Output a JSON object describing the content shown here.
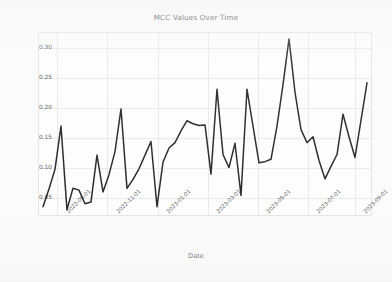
{
  "chart_data": {
    "type": "line",
    "title": "MCC Values Over Time",
    "xlabel": "Date",
    "ylabel": "MCC Value",
    "grid": true,
    "legend": null,
    "line_color": "#141414",
    "background_color": "#fbfbfb",
    "ylim": [
      0.018,
      0.325
    ],
    "ytick_labels": [
      "0.05",
      "0.10",
      "0.15",
      "0.20",
      "0.25",
      "0.30"
    ],
    "ytick_values": [
      0.05,
      0.1,
      0.15,
      0.2,
      0.25,
      0.3
    ],
    "xtick_labels": [
      "2022-09-01",
      "2022-11-01",
      "2023-01-01",
      "2023-03-01",
      "2023-05-01",
      "2023-07-01",
      "2023-09-01"
    ],
    "xtick_positions": [
      0.055,
      0.205,
      0.355,
      0.505,
      0.655,
      0.805,
      0.945
    ],
    "x_index": [
      0,
      1,
      2,
      3,
      4,
      5,
      6,
      7,
      8,
      9,
      10,
      11,
      12,
      13,
      14,
      15,
      16,
      17,
      18,
      19,
      20,
      21,
      22,
      23,
      24,
      25,
      26,
      27,
      28,
      29,
      30,
      31,
      32,
      33,
      34,
      35,
      36,
      37,
      38,
      39,
      40,
      41,
      42,
      43,
      44,
      45,
      46,
      47,
      48,
      49,
      50,
      51,
      52,
      53,
      54
    ],
    "values": [
      0.032,
      0.062,
      0.095,
      0.168,
      0.027,
      0.063,
      0.06,
      0.037,
      0.04,
      0.119,
      0.057,
      0.086,
      0.125,
      0.197,
      0.063,
      0.078,
      0.096,
      0.119,
      0.142,
      0.032,
      0.107,
      0.131,
      0.14,
      0.16,
      0.177,
      0.172,
      0.169,
      0.17,
      0.087,
      0.23,
      0.12,
      0.098,
      0.139,
      0.051,
      0.23,
      0.168,
      0.106,
      0.108,
      0.112,
      0.168,
      0.238,
      0.315,
      0.225,
      0.162,
      0.14,
      0.15,
      0.11,
      0.079,
      0.1,
      0.12,
      0.188,
      0.15,
      0.115,
      0.178,
      0.241
    ]
  }
}
